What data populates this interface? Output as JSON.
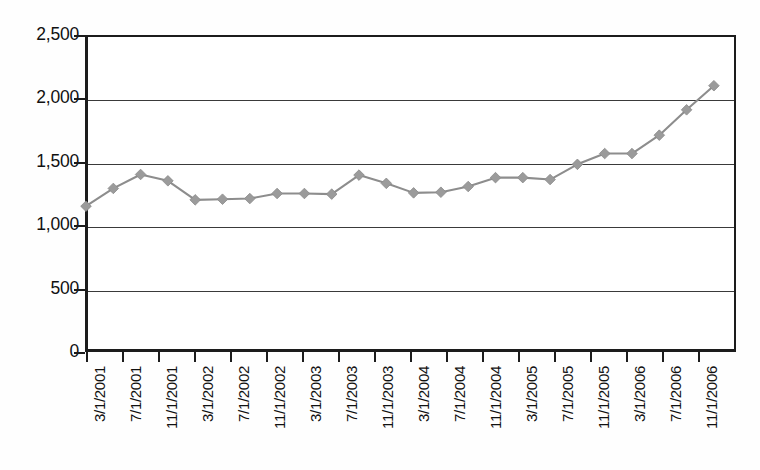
{
  "chart_data": {
    "type": "line",
    "title": "",
    "xlabel": "",
    "ylabel": "",
    "ylim": [
      0,
      2500
    ],
    "y_ticks": [
      0,
      500,
      1000,
      1500,
      2000,
      2500
    ],
    "y_tick_labels": [
      "0",
      "500",
      "1,000",
      "1,500",
      "2,000",
      "2,500"
    ],
    "grid": "horizontal",
    "legend": "none",
    "marker": "diamond",
    "series_color": "#9b9b9b",
    "line_color": "#8d8d8d",
    "axis_color": "#1c1c1c",
    "x_tick_labels": [
      "3/1/2001",
      "7/1/2001",
      "11/1/2001",
      "3/1/2002",
      "7/1/2002",
      "11/1/2002",
      "3/1/2003",
      "7/1/2003",
      "11/1/2003",
      "3/1/2004",
      "7/1/2004",
      "11/1/2004",
      "3/1/2005",
      "7/1/2005",
      "11/1/2005",
      "3/1/2006",
      "7/1/2006",
      "11/1/2006"
    ],
    "x": [
      "2/1/2001",
      "5/1/2001",
      "8/1/2001",
      "11/1/2001",
      "2/1/2002",
      "5/1/2002",
      "8/1/2002",
      "11/1/2002",
      "2/1/2003",
      "5/1/2003",
      "8/1/2003",
      "11/1/2003",
      "2/1/2004",
      "5/1/2004",
      "8/1/2004",
      "11/1/2004",
      "2/1/2005",
      "5/1/2005",
      "8/1/2005",
      "11/1/2005",
      "2/1/2006",
      "5/1/2006",
      "8/1/2006",
      "11/1/2006"
    ],
    "values": [
      1150,
      1290,
      1400,
      1350,
      1200,
      1205,
      1210,
      1250,
      1250,
      1245,
      1395,
      1330,
      1255,
      1260,
      1305,
      1375,
      1375,
      1360,
      1480,
      1565,
      1565,
      1710,
      1910,
      2100
    ]
  }
}
